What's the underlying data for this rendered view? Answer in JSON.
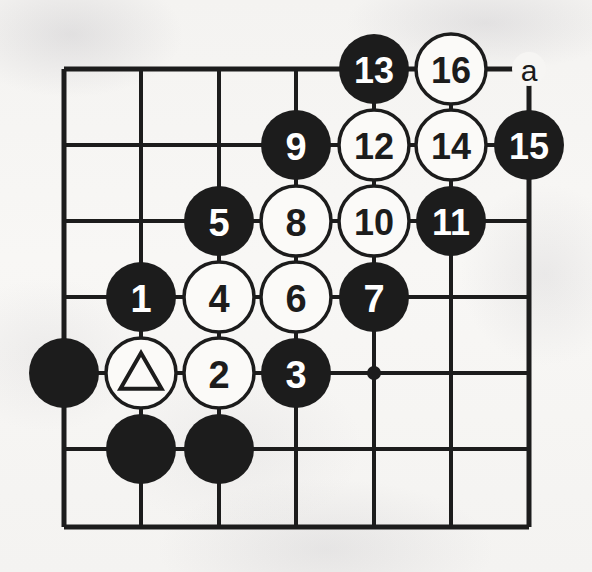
{
  "figure": {
    "kind": "go-board-diagram",
    "board_columns": 7,
    "board_rows": 7,
    "colors": {
      "line": "#1c1c1c",
      "black_stone": "#1c1c1c",
      "white_stone": "#fbfaf8",
      "white_stone_outline": "#1c1c1c",
      "black_stone_text": "#ffffff",
      "white_stone_text": "#1c1c1c",
      "paper": "#f6f5f3"
    },
    "geometry": {
      "col_x": [
        64,
        141,
        219,
        296,
        374,
        451,
        529
      ],
      "row_y": [
        69,
        145,
        221,
        297,
        373,
        449,
        527
      ],
      "stone_radius": 35,
      "line_width": 4
    }
  },
  "star_points": [
    {
      "name": "star-point-center",
      "col": 5,
      "row": 5
    }
  ],
  "coordinate_labels": [
    {
      "name": "point-label-a",
      "text": "a",
      "col": 7,
      "row": 1
    }
  ],
  "stones": [
    {
      "name": "stone-13",
      "color": "black",
      "label": "13",
      "col": 5,
      "row": 1
    },
    {
      "name": "stone-16",
      "color": "white",
      "label": "16",
      "col": 6,
      "row": 1
    },
    {
      "name": "stone-9",
      "color": "black",
      "label": "9",
      "col": 4,
      "row": 2
    },
    {
      "name": "stone-12",
      "color": "white",
      "label": "12",
      "col": 5,
      "row": 2
    },
    {
      "name": "stone-14",
      "color": "white",
      "label": "14",
      "col": 6,
      "row": 2
    },
    {
      "name": "stone-15",
      "color": "black",
      "label": "15",
      "col": 7,
      "row": 2
    },
    {
      "name": "stone-5",
      "color": "black",
      "label": "5",
      "col": 3,
      "row": 3
    },
    {
      "name": "stone-8",
      "color": "white",
      "label": "8",
      "col": 4,
      "row": 3
    },
    {
      "name": "stone-10",
      "color": "white",
      "label": "10",
      "col": 5,
      "row": 3
    },
    {
      "name": "stone-11",
      "color": "black",
      "label": "11",
      "col": 6,
      "row": 3
    },
    {
      "name": "stone-1",
      "color": "black",
      "label": "1",
      "col": 2,
      "row": 4
    },
    {
      "name": "stone-4",
      "color": "white",
      "label": "4",
      "col": 3,
      "row": 4
    },
    {
      "name": "stone-6",
      "color": "white",
      "label": "6",
      "col": 4,
      "row": 4
    },
    {
      "name": "stone-7",
      "color": "black",
      "label": "7",
      "col": 5,
      "row": 4
    },
    {
      "name": "stone-black-a1",
      "color": "black",
      "label": "",
      "col": 1,
      "row": 5
    },
    {
      "name": "stone-white-triangle",
      "color": "white",
      "label": "",
      "mark": "triangle",
      "col": 2,
      "row": 5
    },
    {
      "name": "stone-2",
      "color": "white",
      "label": "2",
      "col": 3,
      "row": 5
    },
    {
      "name": "stone-3",
      "color": "black",
      "label": "3",
      "col": 4,
      "row": 5
    },
    {
      "name": "stone-black-b6",
      "color": "black",
      "label": "",
      "col": 2,
      "row": 6
    },
    {
      "name": "stone-black-c6",
      "color": "black",
      "label": "",
      "col": 3,
      "row": 6
    }
  ]
}
